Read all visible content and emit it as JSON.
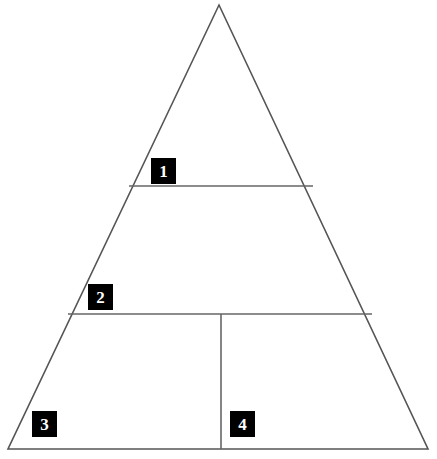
{
  "diagram": {
    "type": "pyramid-diagram",
    "background_color": "#ffffff",
    "line_color": "#555555",
    "label_background_color": "#000000",
    "label_text_color": "#ffffff",
    "apex": {
      "x": 219,
      "y": 5
    },
    "base_left": {
      "x": 8,
      "y": 449
    },
    "base_right": {
      "x": 428,
      "y": 449
    },
    "dividers": {
      "horizontal": [
        {
          "id": "divider-1",
          "y": 186,
          "x1": 129,
          "x2": 313
        },
        {
          "id": "divider-2",
          "y": 314,
          "x1": 68,
          "x2": 372
        }
      ],
      "vertical": [
        {
          "id": "divider-3",
          "x": 221,
          "y1": 314,
          "y2": 449
        }
      ]
    },
    "segments": [
      {
        "id": "segment-1",
        "label": "1",
        "position": "apex-tier",
        "label_box": {
          "x": 151,
          "y": 158,
          "w": 25,
          "h": 26
        }
      },
      {
        "id": "segment-2",
        "label": "2",
        "position": "middle-tier",
        "label_box": {
          "x": 88,
          "y": 284,
          "w": 25,
          "h": 26
        }
      },
      {
        "id": "segment-3",
        "label": "3",
        "position": "base-tier-left",
        "label_box": {
          "x": 32,
          "y": 411,
          "w": 25,
          "h": 26
        }
      },
      {
        "id": "segment-4",
        "label": "4",
        "position": "base-tier-right",
        "label_box": {
          "x": 230,
          "y": 411,
          "w": 25,
          "h": 26
        }
      }
    ]
  }
}
